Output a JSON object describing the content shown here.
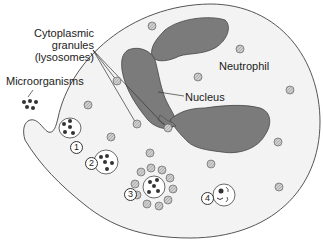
{
  "diagram": {
    "labels": {
      "granules_line1": "Cytoplasmic",
      "granules_line2": "granules",
      "granules_line3": "(lysosomes)",
      "microorganisms": "Microorganisms",
      "neutrophil": "Neutrophil",
      "nucleus": "Nucleus"
    },
    "steps": [
      "1",
      "2",
      "3",
      "4"
    ],
    "colors": {
      "cytoplasm": "#f2f2f2",
      "outline": "#555555",
      "nucleus": "#7b7b7b",
      "granule": "#c8c8c8",
      "microorganism": "#333333"
    }
  }
}
